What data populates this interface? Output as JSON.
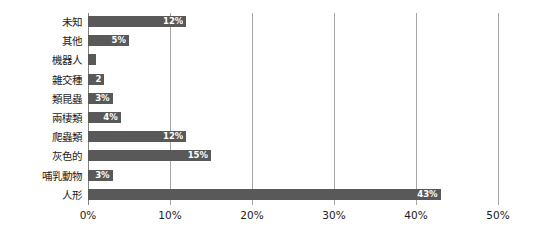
{
  "chart_data": {
    "type": "bar",
    "orientation": "horizontal",
    "title": "",
    "xlabel": "",
    "ylabel": "",
    "xlim": [
      0,
      50
    ],
    "grid": true,
    "legend": null,
    "xticks": [
      "0%",
      "10%",
      "20%",
      "30%",
      "40%",
      "50%"
    ],
    "xtick_values": [
      0,
      10,
      20,
      30,
      40,
      50
    ],
    "categories": [
      "未知",
      "其他",
      "機器人",
      "雜交種",
      "類昆蟲",
      "兩棲類",
      "爬蟲類",
      "灰色的",
      "哺乳動物",
      "人形"
    ],
    "values": [
      12,
      5,
      1,
      2,
      3,
      4,
      12,
      15,
      3,
      43
    ],
    "data_labels": [
      "12%",
      "5%",
      "",
      "2",
      "3%",
      "4%",
      "12%",
      "15%",
      "3%",
      "43%"
    ],
    "colors": {
      "bar": "#595959",
      "gridline": "#a6a6a6",
      "axis": "#808080",
      "background": "#ffffff",
      "label_text": "#1a1a1a",
      "data_label_text": "#ffffff"
    }
  }
}
